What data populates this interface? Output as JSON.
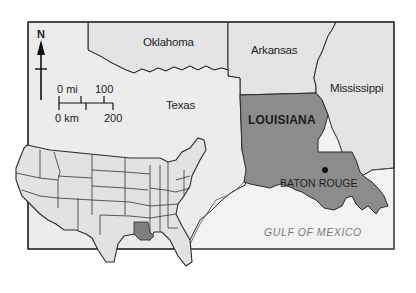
{
  "map": {
    "title": "Louisiana location map",
    "colors": {
      "land": "#e6e6e6",
      "louisiana": "#8a8a8a",
      "water": "#f4f4f4",
      "border": "#2a2a2a",
      "frame": "#333333"
    },
    "states": {
      "oklahoma": "Oklahoma",
      "arkansas": "Arkansas",
      "mississippi": "Mississippi",
      "texas": "Texas",
      "louisiana": "LOUISIANA"
    },
    "capital": {
      "name": "BATON ROUGE",
      "marker": "city-dot"
    },
    "water_body": "GULF OF MEXICO",
    "north_arrow": {
      "label": "N",
      "icon": "north-arrow-icon"
    },
    "scale_bar": {
      "mi_start": "0 mi",
      "mi_end": "100",
      "km_start": "0 km",
      "km_end": "200"
    },
    "inset": {
      "description": "Contiguous United States with Louisiana highlighted",
      "highlight": "Louisiana"
    }
  }
}
